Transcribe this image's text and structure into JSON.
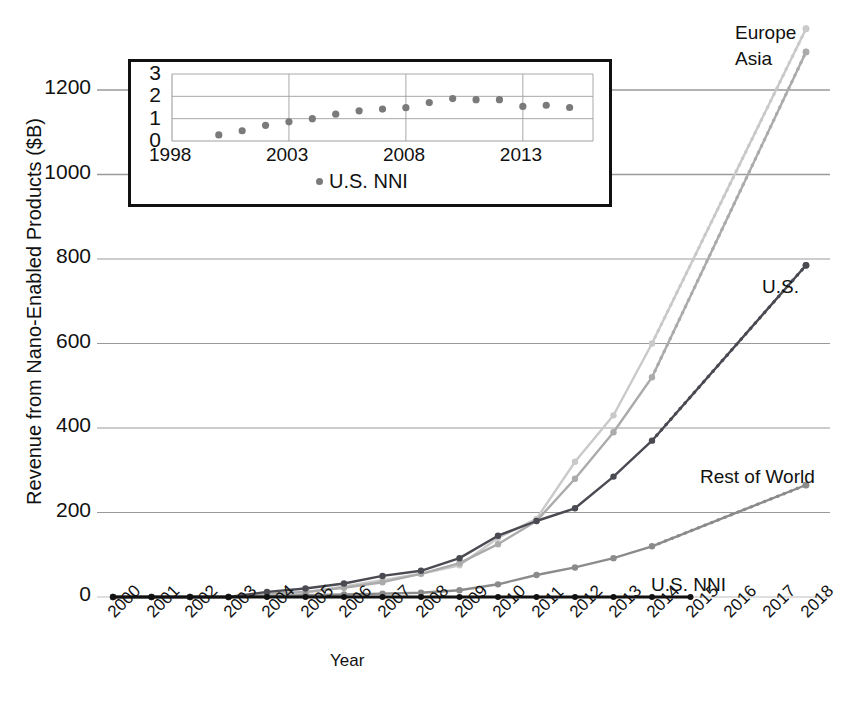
{
  "chart_data": {
    "type": "line",
    "title": "",
    "xlabel": "Year",
    "ylabel": "Revenue from Nano-Enabled Products ($B)",
    "grid": true,
    "legend_position": "inline-right-of-series",
    "xlim": [
      2000,
      2018
    ],
    "ylim": [
      0,
      1300
    ],
    "yticks": [
      "0",
      "200",
      "400",
      "600",
      "800",
      "1000",
      "1200"
    ],
    "ytick_values": [
      0,
      200,
      400,
      600,
      800,
      1000,
      1200
    ],
    "xticks": [
      "2000",
      "2001",
      "2002",
      "2003",
      "2004",
      "2005",
      "2006",
      "2007",
      "2008",
      "2009",
      "2010",
      "2011",
      "2012",
      "2013",
      "2014",
      "2015",
      "2016",
      "2017",
      "2018"
    ],
    "x": [
      2000,
      2001,
      2002,
      2003,
      2004,
      2005,
      2006,
      2007,
      2008,
      2009,
      2010,
      2011,
      2012,
      2013,
      2014,
      2015,
      2016,
      2017,
      2018
    ],
    "series": [
      {
        "name": "Europe",
        "label": "Europe",
        "color": "#c9c9c9",
        "solid_through": 2014,
        "values": [
          0,
          0,
          0,
          0,
          5,
          10,
          25,
          40,
          55,
          75,
          140,
          185,
          320,
          430,
          600,
          null,
          null,
          null,
          1345
        ],
        "projection": [
          2014,
          2018
        ],
        "projection_values": [
          600,
          1345
        ]
      },
      {
        "name": "Asia",
        "label": "Asia",
        "color": "#ababab",
        "solid_through": 2014,
        "values": [
          0,
          0,
          0,
          0,
          8,
          12,
          22,
          35,
          55,
          80,
          125,
          180,
          280,
          390,
          520,
          null,
          null,
          null,
          1290
        ],
        "projection": [
          2014,
          2018
        ],
        "projection_values": [
          520,
          1290
        ]
      },
      {
        "name": "U.S.",
        "label": "U.S.",
        "color": "#4a4a52",
        "solid_through": 2014,
        "values": [
          0,
          0,
          0,
          0,
          12,
          20,
          32,
          50,
          62,
          92,
          145,
          180,
          210,
          285,
          370,
          null,
          null,
          null,
          785
        ],
        "projection": [
          2014,
          2018
        ],
        "projection_values": [
          370,
          785
        ]
      },
      {
        "name": "Rest of World",
        "label": "Rest of World",
        "color": "#8b8b8b",
        "solid_through": 2014,
        "values": [
          0,
          0,
          0,
          0,
          2,
          4,
          6,
          8,
          10,
          16,
          30,
          52,
          70,
          92,
          120,
          null,
          null,
          null,
          265
        ],
        "projection": [
          2014,
          2018
        ],
        "projection_values": [
          120,
          265
        ]
      },
      {
        "name": "U.S. NNI",
        "label": "U.S. NNI",
        "color": "#111111",
        "solid_through": 2015,
        "values": [
          0.27,
          0.46,
          0.7,
          0.86,
          1.0,
          1.2,
          1.35,
          1.43,
          1.49,
          1.72,
          1.9,
          1.85,
          1.85,
          1.55,
          1.6,
          1.5,
          null,
          null,
          null
        ]
      }
    ],
    "series_label_positions": [
      {
        "name": "Europe",
        "x": 735,
        "y": 22
      },
      {
        "name": "Asia",
        "x": 735,
        "y": 48
      },
      {
        "name": "U.S.",
        "x": 762,
        "y": 276
      },
      {
        "name": "Rest of World",
        "x": 700,
        "y": 466
      },
      {
        "name": "U.S. NNI",
        "x": 651,
        "y": 574
      }
    ],
    "inset": {
      "type": "scatter",
      "xlabel": "",
      "ylabel": "",
      "legend": "U.S. NNI",
      "legend_marker_color": "#7a7a7a",
      "yticks": [
        "0",
        "1",
        "2",
        "3"
      ],
      "ytick_values": [
        0,
        1,
        2,
        3
      ],
      "xticks": [
        "1998",
        "2003",
        "2008",
        "2013"
      ],
      "xtick_values": [
        1998,
        2003,
        2008,
        2013
      ],
      "xlim": [
        1998,
        2016
      ],
      "ylim": [
        0,
        3
      ],
      "x": [
        2000,
        2001,
        2002,
        2003,
        2004,
        2005,
        2006,
        2007,
        2008,
        2009,
        2010,
        2011,
        2012,
        2013,
        2014,
        2015
      ],
      "values": [
        0.27,
        0.46,
        0.7,
        0.86,
        1.0,
        1.2,
        1.35,
        1.43,
        1.49,
        1.72,
        1.9,
        1.85,
        1.85,
        1.55,
        1.6,
        1.5
      ],
      "point_color": "#7a7a7a"
    }
  }
}
